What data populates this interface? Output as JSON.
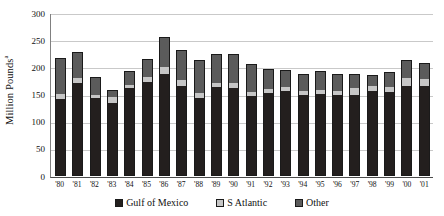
{
  "chart_data": {
    "type": "bar",
    "title": "",
    "subtitle": "",
    "xlabel": "",
    "ylabel": "Million Pounds",
    "ylabel_superscript": "a",
    "ylim": [
      0,
      300
    ],
    "yticks": [
      300,
      250,
      200,
      150,
      100,
      50,
      0
    ],
    "ytick_labels": [
      "300",
      "250",
      "200",
      "150",
      "100",
      "50",
      "0"
    ],
    "grid": true,
    "grid_axis": "y",
    "stacked": true,
    "legend_position": "bottom",
    "categories": [
      "'80",
      "'81",
      "'82",
      "'83",
      "'84",
      "'85",
      "'86",
      "'87",
      "'88",
      "'89",
      "'90",
      "'91",
      "'92",
      "'93",
      "'94",
      "'95",
      "'96",
      "'97",
      "'98",
      "'99",
      "'00",
      "'01"
    ],
    "series": [
      {
        "name": "Gulf of Mexico",
        "color": "#231f1e",
        "values": [
          139,
          170,
          141,
          133,
          160,
          172,
          185,
          163,
          141,
          162,
          160,
          145,
          151,
          155,
          148,
          150,
          147,
          148,
          155,
          152,
          163,
          163
        ]
      },
      {
        "name": "S Atlantic",
        "color": "#c6c6c6",
        "values": [
          10,
          8,
          7,
          11,
          6,
          9,
          13,
          11,
          10,
          8,
          9,
          8,
          8,
          7,
          7,
          7,
          8,
          12,
          8,
          10,
          15,
          13
        ]
      },
      {
        "name": "Other",
        "color": "#5b5b5b",
        "values": [
          65,
          46,
          30,
          11,
          23,
          30,
          55,
          55,
          58,
          51,
          52,
          50,
          35,
          30,
          30,
          33,
          30,
          24,
          20,
          26,
          32,
          28
        ]
      }
    ],
    "totals": [
      214,
      224,
      178,
      155,
      189,
      211,
      253,
      229,
      209,
      221,
      221,
      203,
      194,
      192,
      185,
      190,
      185,
      184,
      183,
      188,
      210,
      204
    ]
  },
  "legend": {
    "items": [
      {
        "label": "Gulf of Mexico",
        "color": "#231f1e"
      },
      {
        "label": "S Atlantic",
        "color": "#c6c6c6"
      },
      {
        "label": "Other",
        "color": "#5b5b5b"
      }
    ]
  }
}
